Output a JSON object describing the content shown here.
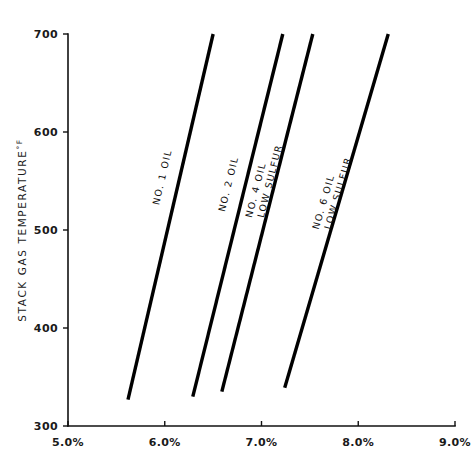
{
  "chart_data": {
    "type": "line",
    "title": "",
    "xlabel": "",
    "ylabel": "STACK GAS TEMPERATURE °F",
    "ylabel_text": "STACK GAS TEMPERATURE",
    "ylabel_unit": "°F",
    "xlim": [
      5.0,
      9.0
    ],
    "ylim": [
      300,
      700
    ],
    "grid": false,
    "legend_position": "inline-on-lines",
    "x_tick_labels": [
      "5.0%",
      "6.0%",
      "7.0%",
      "8.0%",
      "9.0%"
    ],
    "x_tick_values": [
      5.0,
      6.0,
      7.0,
      8.0,
      9.0
    ],
    "y_tick_labels": [
      "300",
      "400",
      "500",
      "600",
      "700"
    ],
    "y_tick_values": [
      300,
      400,
      500,
      600,
      700
    ],
    "series": [
      {
        "name": "NO. 1 OIL",
        "label_lines": [
          "NO. 1 OIL"
        ],
        "color": "#000000",
        "x": [
          5.62,
          6.5
        ],
        "y": [
          327,
          700
        ],
        "label_x": 5.94,
        "label_y": 525
      },
      {
        "name": "NO. 2 OIL",
        "label_lines": [
          "NO. 2 OIL"
        ],
        "color": "#000000",
        "x": [
          6.29,
          7.22
        ],
        "y": [
          330,
          700
        ],
        "label_x": 6.62,
        "label_y": 518
      },
      {
        "name": "NO. 4 OIL LOW SULFUR",
        "label_lines": [
          "NO. 4 OIL",
          "LOW SULFUR"
        ],
        "color": "#000000",
        "x": [
          6.59,
          7.53
        ],
        "y": [
          335,
          700
        ],
        "label_x": 6.9,
        "label_y": 512
      },
      {
        "name": "NO. 6 OIL LOW SULFUR",
        "label_lines": [
          "NO. 6 OIL",
          "LOW SULFUR"
        ],
        "color": "#000000",
        "x": [
          7.24,
          8.31
        ],
        "y": [
          339,
          700
        ],
        "label_x": 7.59,
        "label_y": 500
      }
    ]
  },
  "axis": {
    "y_label_full": "STACK GAS TEMPERATURE °F",
    "y_label_main": "STACK GAS TEMPERATURE",
    "y_label_degree": "°F"
  },
  "ticks": {
    "y": [
      {
        "label": "700",
        "value": 700
      },
      {
        "label": "600",
        "value": 600
      },
      {
        "label": "500",
        "value": 500
      },
      {
        "label": "400",
        "value": 400
      },
      {
        "label": "300",
        "value": 300
      }
    ],
    "x": [
      {
        "label": "5.0%",
        "value": 5.0
      },
      {
        "label": "6.0%",
        "value": 6.0
      },
      {
        "label": "7.0%",
        "value": 7.0
      },
      {
        "label": "8.0%",
        "value": 8.0
      },
      {
        "label": "9.0%",
        "value": 9.0
      }
    ]
  }
}
